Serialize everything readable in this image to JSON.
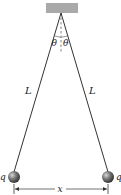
{
  "diagram": {
    "labels": {
      "theta_left": "θ",
      "theta_right": "θ",
      "length_left": "L",
      "length_right": "L",
      "charge_left": "q",
      "charge_right": "q",
      "separation": "x"
    },
    "colors": {
      "ceiling": "#a9a9a9",
      "string": "#333333",
      "sphere": "#6e6e6e",
      "text": "#222222"
    }
  }
}
